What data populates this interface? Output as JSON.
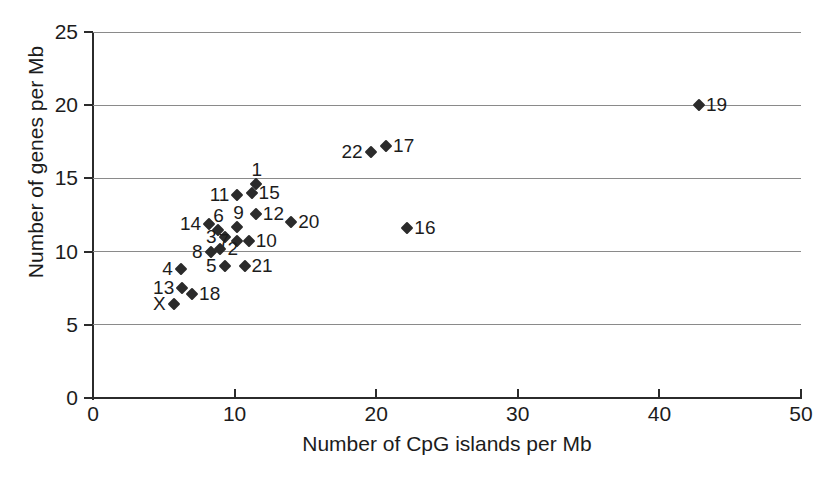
{
  "chart_data": {
    "type": "scatter",
    "title": "",
    "xlabel": "Number of CpG islands per Mb",
    "ylabel": "Number of genes per Mb",
    "xlim": [
      0,
      50
    ],
    "ylim": [
      0,
      25
    ],
    "xticks": [
      "0",
      "10",
      "20",
      "30",
      "40",
      "50"
    ],
    "yticks": [
      "0",
      "5",
      "10",
      "15",
      "20",
      "25"
    ],
    "xtick_values": [
      0,
      10,
      20,
      30,
      40,
      50
    ],
    "ytick_values": [
      0,
      5,
      10,
      15,
      20,
      25
    ],
    "grid": "horizontal",
    "legend": "none",
    "marker": "filled-diamond",
    "marker_color": "#2b2b2b",
    "points": [
      {
        "label": "1",
        "x": 11.5,
        "y": 14.6,
        "label_pos": "above"
      },
      {
        "label": "11",
        "x": 10.2,
        "y": 13.9,
        "label_pos": "left"
      },
      {
        "label": "15",
        "x": 11.2,
        "y": 14.0,
        "label_pos": "right"
      },
      {
        "label": "14",
        "x": 8.2,
        "y": 11.9,
        "label_pos": "left"
      },
      {
        "label": "6",
        "x": 8.8,
        "y": 11.5,
        "label_pos": "above"
      },
      {
        "label": "9",
        "x": 10.2,
        "y": 11.7,
        "label_pos": "above"
      },
      {
        "label": "12",
        "x": 11.5,
        "y": 12.6,
        "label_pos": "right"
      },
      {
        "label": "20",
        "x": 14.0,
        "y": 12.0,
        "label_pos": "right"
      },
      {
        "label": "3",
        "x": 9.3,
        "y": 11.0,
        "label_pos": "left"
      },
      {
        "label": "7",
        "x": 10.2,
        "y": 10.7,
        "label_pos": "left"
      },
      {
        "label": "10",
        "x": 11.0,
        "y": 10.7,
        "label_pos": "right"
      },
      {
        "label": "8",
        "x": 8.3,
        "y": 10.0,
        "label_pos": "left"
      },
      {
        "label": "2",
        "x": 9.0,
        "y": 10.2,
        "label_pos": "right"
      },
      {
        "label": "4",
        "x": 6.2,
        "y": 8.8,
        "label_pos": "left"
      },
      {
        "label": "5",
        "x": 9.3,
        "y": 9.0,
        "label_pos": "left"
      },
      {
        "label": "21",
        "x": 10.7,
        "y": 9.0,
        "label_pos": "right"
      },
      {
        "label": "13",
        "x": 6.3,
        "y": 7.5,
        "label_pos": "left"
      },
      {
        "label": "18",
        "x": 7.0,
        "y": 7.1,
        "label_pos": "right"
      },
      {
        "label": "X",
        "x": 5.7,
        "y": 6.4,
        "label_pos": "left"
      },
      {
        "label": "16",
        "x": 22.2,
        "y": 11.6,
        "label_pos": "right"
      },
      {
        "label": "22",
        "x": 19.6,
        "y": 16.8,
        "label_pos": "left"
      },
      {
        "label": "17",
        "x": 20.7,
        "y": 17.2,
        "label_pos": "right"
      },
      {
        "label": "19",
        "x": 42.8,
        "y": 20.0,
        "label_pos": "right"
      }
    ]
  }
}
